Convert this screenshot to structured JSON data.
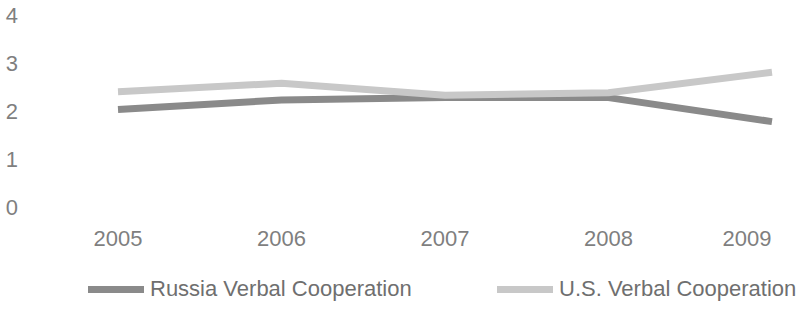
{
  "chart_data": {
    "type": "line",
    "title": "",
    "subtitle": "",
    "xlabel": "",
    "ylabel": "",
    "categories": [
      "2005",
      "2006",
      "2007",
      "2008",
      "2009"
    ],
    "x": [
      2005,
      2006,
      2007,
      2008,
      2009
    ],
    "series": [
      {
        "name": "Russia Verbal Cooperation",
        "values": [
          2.05,
          2.25,
          2.3,
          2.3,
          1.8
        ],
        "color": "#8a8a8a"
      },
      {
        "name": "U.S. Verbal Cooperation",
        "values": [
          2.42,
          2.6,
          2.35,
          2.4,
          2.83
        ],
        "color": "#c8c8c8"
      }
    ],
    "ylim": [
      0,
      4
    ],
    "yticks": [
      "4",
      "3",
      "2",
      "1",
      "0"
    ],
    "ytick_values": [
      4,
      3,
      2,
      1,
      0
    ],
    "xlim": [
      2005,
      2009
    ],
    "grid": false,
    "legend_position": "bottom"
  },
  "axes": {
    "y_ticks": [
      {
        "label": "4",
        "value": 4
      },
      {
        "label": "3",
        "value": 3
      },
      {
        "label": "2",
        "value": 2
      },
      {
        "label": "1",
        "value": 1
      },
      {
        "label": "0",
        "value": 0
      }
    ],
    "x_ticks": [
      {
        "label": "2005",
        "value": 2005
      },
      {
        "label": "2006",
        "value": 2006
      },
      {
        "label": "2007",
        "value": 2007
      },
      {
        "label": "2008",
        "value": 2008
      },
      {
        "label": "2009",
        "value": 2009
      }
    ]
  },
  "legend": {
    "entries": [
      {
        "label": "Russia Verbal Cooperation",
        "color": "#8a8a8a"
      },
      {
        "label": "U.S. Verbal Cooperation",
        "color": "#c8c8c8"
      }
    ]
  },
  "colors": {
    "background": "#ffffff",
    "text": "#7f7f7f",
    "series_russia": "#8a8a8a",
    "series_us": "#c8c8c8"
  }
}
